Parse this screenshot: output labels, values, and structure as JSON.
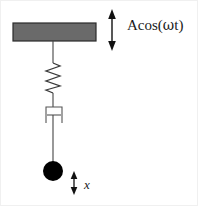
{
  "figure": {
    "width": 198,
    "height": 206,
    "background_color": "#ffffff",
    "border_color": "#f0f0f0"
  },
  "labels": {
    "forcing": {
      "text": "Acos(ωt)",
      "prefix": "Acos(",
      "omega": "ω",
      "suffix": "t)"
    },
    "displacement": {
      "text": "x"
    }
  },
  "elements": {
    "support_block": {
      "name": "ceiling support block",
      "fill": "#6a6a6a",
      "stroke": "#2b2b2b",
      "x": 12,
      "y": 22,
      "width": 83,
      "height": 18
    },
    "rod_upper": {
      "name": "upper connecting rod",
      "stroke": "#444444",
      "x": 52,
      "y1": 40,
      "y2": 62
    },
    "spring": {
      "name": "spring",
      "stroke": "#3a3a3a",
      "x_center": 52,
      "y_top": 62,
      "y_bottom": 92,
      "amplitude": 7,
      "coils": 6
    },
    "rod_middle": {
      "name": "middle connecting rod",
      "stroke": "#444444",
      "x": 52,
      "y1": 92,
      "y2": 105
    },
    "damper": {
      "name": "dashpot damper",
      "stroke": "#555555",
      "box_x": 44,
      "box_y": 105,
      "box_width": 17,
      "box_height": 17,
      "piston_y": 114,
      "piston_half_width": 6
    },
    "rod_lower": {
      "name": "lower connecting rod",
      "stroke": "#444444",
      "x": 52,
      "y1": 114,
      "y2": 161
    },
    "mass": {
      "name": "point mass bob",
      "fill": "#000000",
      "cx": 52,
      "cy": 170,
      "r": 10
    },
    "arrow_forcing": {
      "name": "base excitation double arrow",
      "stroke": "#111111",
      "x": 111,
      "y_top": 10,
      "y_bottom": 48
    },
    "arrow_displacement": {
      "name": "displacement double arrow",
      "stroke": "#111111",
      "x": 73,
      "y_top": 171,
      "y_bottom": 192
    }
  }
}
